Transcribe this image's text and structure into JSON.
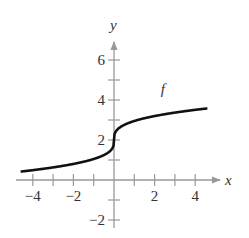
{
  "chart_data": {
    "type": "line",
    "title": "",
    "xlabel": "x",
    "ylabel": "y",
    "xlim": [
      -4.6,
      5.2
    ],
    "ylim": [
      -2.6,
      7
    ],
    "x_ticks": [
      -4,
      -2,
      2,
      4
    ],
    "x_tick_labels": [
      "−4",
      "−2",
      "2",
      "4"
    ],
    "y_ticks": [
      -2,
      2,
      4,
      6
    ],
    "y_tick_labels": [
      "−2",
      "2",
      "4",
      "6"
    ],
    "grid": false,
    "series": [
      {
        "name": "f",
        "formula": "f(x) = 2 + cbrt(x)",
        "x": [
          -4.6,
          -4,
          -3,
          -2,
          -1,
          -0.5,
          -0.1,
          0,
          0.1,
          0.5,
          1,
          2,
          3,
          4,
          4.6
        ],
        "y": [
          0.34,
          0.41,
          0.56,
          0.74,
          1.0,
          1.21,
          1.54,
          2.0,
          2.46,
          2.79,
          3.0,
          3.26,
          3.44,
          3.59,
          3.66
        ]
      }
    ],
    "annotations": [
      {
        "text": "f",
        "x": 2.3,
        "y": 4.3
      }
    ]
  }
}
